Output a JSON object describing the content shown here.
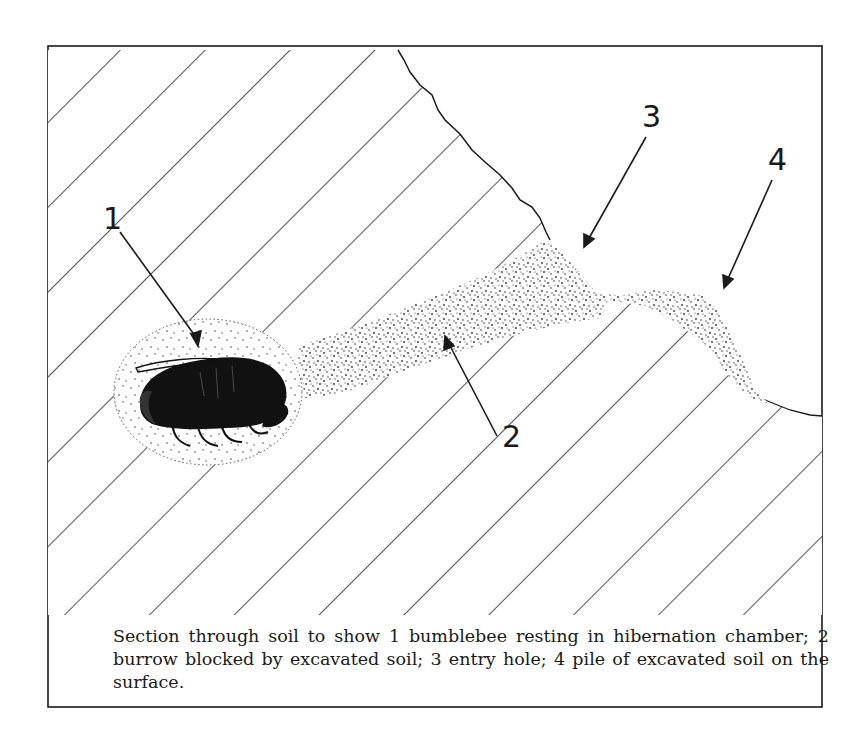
{
  "figure": {
    "caption": "Section through soil to show 1 bumblebee resting in hibernation chamber; 2 burrow blocked by excavated soil; 3 entry hole; 4 pile of excavated soil on the surface.",
    "labels": [
      {
        "id": "1",
        "text": "1",
        "meaning": "bumblebee resting in hibernation chamber"
      },
      {
        "id": "2",
        "text": "2",
        "meaning": "burrow blocked by excavated soil"
      },
      {
        "id": "3",
        "text": "3",
        "meaning": "entry hole"
      },
      {
        "id": "4",
        "text": "4",
        "meaning": "pile of excavated soil on the surface"
      }
    ],
    "colors": {
      "ink": "#1a1a1a",
      "paper": "#ffffff",
      "stipple": "#3a3a3a"
    }
  }
}
